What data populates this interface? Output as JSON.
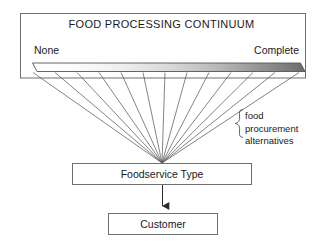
{
  "diagram": {
    "continuum": {
      "heading": "FOOD PROCESSING CONTINUUM",
      "left_endpoint_label": "None",
      "right_endpoint_label": "Complete",
      "gradient_from": "#ffffff",
      "gradient_to": "#6e6e6e",
      "fan_line_count": 13
    },
    "brace": {
      "line1": "food",
      "line2": "procurement",
      "line3": "alternatives"
    },
    "nodes": [
      {
        "id": "foodservice-type",
        "label": "Foodservice Type"
      },
      {
        "id": "customer",
        "label": "Customer"
      }
    ],
    "colors": {
      "stroke": "#4a4a4a",
      "text": "#1a1a1a",
      "background": "#ffffff",
      "bar_dark": "#6e6e6e"
    }
  }
}
